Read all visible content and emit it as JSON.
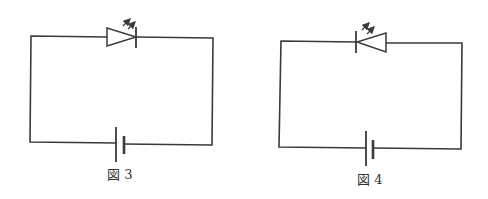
{
  "figures": [
    {
      "id": "fig3",
      "caption": "図 3",
      "components": [
        "LED (anode left, cathode right)",
        "battery (long plate left, short plate right)"
      ],
      "led_orientation": "forward-right"
    },
    {
      "id": "fig4",
      "caption": "図 4",
      "components": [
        "LED (cathode left, anode right)",
        "battery (long plate left, short plate right)"
      ],
      "led_orientation": "reverse-left"
    }
  ],
  "colors": {
    "line": "#3a3a3a",
    "background": "#ffffff"
  }
}
